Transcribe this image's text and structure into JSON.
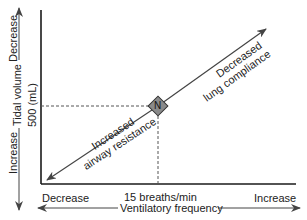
{
  "diagram": {
    "y_axis": {
      "label": "Tidal volume",
      "top_label": "Decrease",
      "bottom_label": "Increase",
      "reference_value": "500 (mL)"
    },
    "x_axis": {
      "label": "Ventilatory frequency",
      "left_label": "Decrease",
      "right_label": "Increase",
      "reference_value": "15 breaths/min"
    },
    "normal_point": {
      "label": "N",
      "fill": "#8a8a8a"
    },
    "arrows": [
      {
        "label_line1": "Decreased",
        "label_line2": "lung compliance",
        "direction": "up-right"
      },
      {
        "label_line1": "Increased",
        "label_line2": "airway resistance",
        "direction": "down-left"
      }
    ],
    "colors": {
      "axis": "#1a1a1a",
      "arrow": "#444444",
      "dashed": "#555555",
      "text": "#222222"
    }
  }
}
